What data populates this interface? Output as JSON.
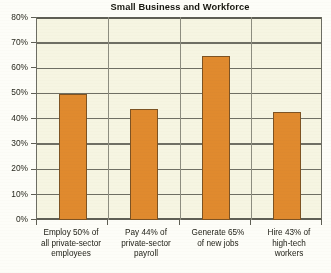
{
  "chart_data": {
    "type": "bar",
    "title": "Small Business and Workforce",
    "xlabel": "",
    "ylabel": "",
    "ylim": [
      0,
      80
    ],
    "ytick_labels": [
      "80%",
      "70%",
      "60%",
      "50%",
      "40%",
      "30%",
      "20%",
      "10%",
      "0%"
    ],
    "ytick_values": [
      80,
      70,
      60,
      50,
      40,
      30,
      20,
      10,
      0
    ],
    "grid": true,
    "legend": "none",
    "categories": [
      "Employ 50% of all private-sector employees",
      "Pay 44% of private-sector payroll",
      "Generate 65% of new jobs",
      "Hire 43% of high-tech workers"
    ],
    "category_lines": [
      [
        "Employ 50% of",
        "all private-sector",
        "employees"
      ],
      [
        "Pay 44% of",
        "private-sector",
        "payroll"
      ],
      [
        "Generate 65%",
        "of new jobs"
      ],
      [
        "Hire 43% of",
        "high-tech",
        "workers"
      ]
    ],
    "values": [
      50,
      44,
      65,
      43
    ],
    "value_labels": [
      "50%",
      "44%",
      "65%",
      "43%"
    ],
    "colors": {
      "bar_fill": "#e08a2e",
      "bar_outline": "#7d5323",
      "plot_background": "#f6f5e2",
      "gridline": "#6f6f64",
      "axis": "#5f5f55",
      "text": "#23231a",
      "page_background": "#fdfdf8"
    }
  }
}
